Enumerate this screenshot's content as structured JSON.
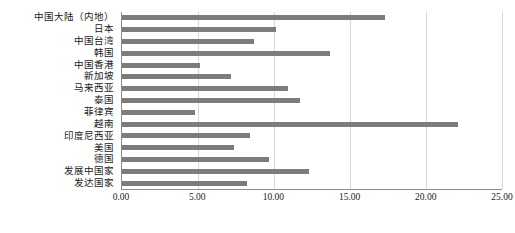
{
  "chart_data": {
    "type": "bar",
    "orientation": "horizontal",
    "title": "",
    "subtitle": "",
    "xlabel": "",
    "ylabel": "",
    "xlim": [
      0,
      25
    ],
    "xticks": [
      0,
      5,
      10,
      15,
      20,
      25
    ],
    "xtick_labels": [
      "0.00",
      "5.00",
      "10.00",
      "15.00",
      "20.00",
      "25.00"
    ],
    "grid": true,
    "grid_axis": "x",
    "legend": false,
    "bar_color": "#7c7c7c",
    "categories": [
      "中国大陆（内地）",
      "日本",
      "中国台湾",
      "韩国",
      "中国香港",
      "新加坡",
      "马来西亚",
      "泰国",
      "菲律宾",
      "越南",
      "印度尼西亚",
      "美国",
      "德国",
      "发展中国家",
      "发达国家"
    ],
    "values": [
      17.3,
      10.1,
      8.7,
      13.7,
      5.1,
      7.2,
      10.9,
      11.7,
      4.8,
      22.1,
      8.4,
      7.4,
      9.7,
      12.3,
      8.2
    ]
  }
}
